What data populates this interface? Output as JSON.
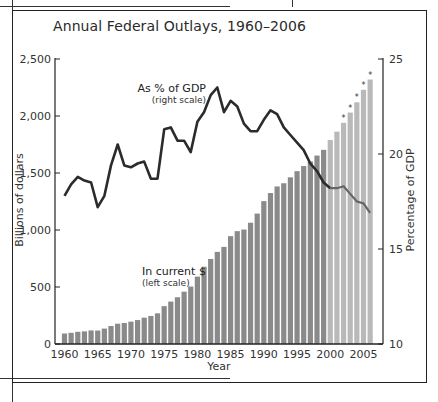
{
  "title": "Annual Federal Outlays, 1960–2006",
  "annotations": {
    "line_label": "As % of GDP",
    "line_sub": "(right scale)",
    "bar_label": "In current $",
    "bar_sub": "(left scale)"
  },
  "axes": {
    "xlabel": "Year",
    "ylabel_left": "Billions of dollars",
    "ylabel_right": "Percentage of GDP",
    "x_ticks": [
      "1960",
      "1965",
      "1970",
      "1975",
      "1980",
      "1985",
      "1990",
      "1995",
      "2000",
      "2005"
    ],
    "y_left_ticks": [
      "0",
      "500",
      "1,000",
      "1,500",
      "2,000",
      "2,500"
    ],
    "y_right_ticks": [
      "10",
      "15",
      "20",
      "25"
    ]
  },
  "colors": {
    "bar": "#8a8a8a",
    "bar_estimate": "#b9b9b9",
    "line": "#2b2b2b",
    "line_late": "#666666"
  },
  "chart_data": {
    "type": "bar+line",
    "title": "Annual Federal Outlays, 1960–2006",
    "xlabel": "Year",
    "ylabel": "Billions of dollars",
    "ylabel_right": "Percentage of GDP",
    "ylim": [
      0,
      2500
    ],
    "ylim_right": [
      10,
      25
    ],
    "grid": false,
    "x": [
      1960,
      1961,
      1962,
      1963,
      1964,
      1965,
      1966,
      1967,
      1968,
      1969,
      1970,
      1971,
      1972,
      1973,
      1974,
      1975,
      1976,
      1977,
      1978,
      1979,
      1980,
      1981,
      1982,
      1983,
      1984,
      1985,
      1986,
      1987,
      1988,
      1989,
      1990,
      1991,
      1992,
      1993,
      1994,
      1995,
      1996,
      1997,
      1998,
      1999,
      2000,
      2001,
      2002,
      2003,
      2004,
      2005,
      2006
    ],
    "series": [
      {
        "name": "In current $ (left scale)",
        "type": "bar",
        "values": [
          92,
          98,
          107,
          111,
          119,
          118,
          135,
          158,
          178,
          184,
          196,
          210,
          231,
          246,
          269,
          332,
          372,
          410,
          459,
          504,
          591,
          678,
          746,
          808,
          852,
          946,
          990,
          1004,
          1064,
          1144,
          1253,
          1324,
          1382,
          1410,
          1462,
          1516,
          1561,
          1601,
          1653,
          1703,
          1789,
          1863,
          1940,
          2030,
          2120,
          2230,
          2320
        ]
      },
      {
        "name": "As % of GDP (right scale)",
        "type": "line",
        "values": [
          17.8,
          18.4,
          18.8,
          18.6,
          18.5,
          17.2,
          17.8,
          19.4,
          20.5,
          19.4,
          19.3,
          19.5,
          19.6,
          18.7,
          18.7,
          21.3,
          21.4,
          20.7,
          20.7,
          20.1,
          21.7,
          22.2,
          23.1,
          23.5,
          22.2,
          22.8,
          22.5,
          21.6,
          21.2,
          21.2,
          21.8,
          22.3,
          22.1,
          21.4,
          21.0,
          20.6,
          20.2,
          19.5,
          19.1,
          18.5,
          18.2,
          18.2,
          18.3,
          17.9,
          17.5,
          17.4,
          16.9
        ]
      }
    ],
    "starred_years": [
      2002,
      2003,
      2004,
      2005,
      2006
    ]
  }
}
